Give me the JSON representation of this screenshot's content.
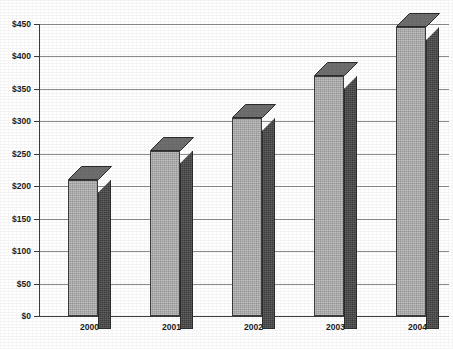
{
  "chart_data": {
    "type": "bar",
    "title": "",
    "subtitle": "",
    "xlabel": "",
    "ylabel": "",
    "categories": [
      "2000",
      "2001",
      "2002",
      "2003",
      "2004"
    ],
    "values": [
      210,
      255,
      305,
      370,
      445
    ],
    "value_prefix": "$",
    "ylim": [
      0,
      450
    ],
    "ytick_step": 50,
    "ytick_labels": [
      "$450",
      "$400",
      "$350",
      "$300",
      "$250",
      "$200",
      "$150",
      "$100",
      "$50",
      "$0"
    ],
    "ytick_values": [
      450,
      400,
      350,
      300,
      250,
      200,
      150,
      100,
      50,
      0
    ],
    "grid": true,
    "grid_orientation": "horizontal",
    "legend": false,
    "legend_position": "none",
    "style": "3d-column",
    "series": [
      {
        "name": "",
        "values": [
          210,
          255,
          305,
          370,
          445
        ]
      }
    ],
    "colors": {
      "bar_front": "#b2b2b2",
      "bar_side": "#4c4c4c",
      "bar_top": "#6e6e6e",
      "bar_outline": "#3d3d3d",
      "gridline": "#8c8c8c",
      "axis": "#3c3c3c",
      "text": "#1c1c1c",
      "background": "#ffffff"
    }
  },
  "axes": {
    "y_ticks": [
      {
        "label": "$450",
        "value": 450
      },
      {
        "label": "$400",
        "value": 400
      },
      {
        "label": "$350",
        "value": 350
      },
      {
        "label": "$300",
        "value": 300
      },
      {
        "label": "$250",
        "value": 250
      },
      {
        "label": "$200",
        "value": 200
      },
      {
        "label": "$150",
        "value": 150
      },
      {
        "label": "$100",
        "value": 100
      },
      {
        "label": "$50",
        "value": 50
      },
      {
        "label": "$0",
        "value": 0
      }
    ],
    "x_ticks": [
      {
        "label": "2000"
      },
      {
        "label": "2001"
      },
      {
        "label": "2002"
      },
      {
        "label": "2003"
      },
      {
        "label": "2004"
      }
    ]
  },
  "footer": {
    "caption_sliver": ""
  }
}
